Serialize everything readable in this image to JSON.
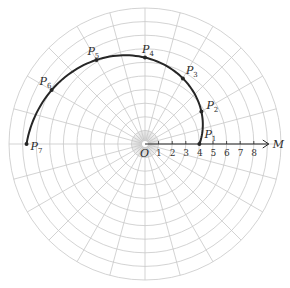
{
  "diagram": {
    "type": "polar-coordinate-grid",
    "center": {
      "x": 145,
      "y": 144
    },
    "unit_px": 13.6,
    "rings": 10,
    "spokes": 24,
    "inner_fine_spokes": 72,
    "inner_fine_radius_units": 1,
    "colors": {
      "grid": "#c8c8c8",
      "curve": "#262626",
      "axis": "#262626",
      "text": "#2a2a2a"
    },
    "origin_label": "O",
    "axis_label": "M",
    "axis_ticks": [
      "1",
      "2",
      "3",
      "4",
      "5",
      "6",
      "7",
      "8"
    ],
    "curve": {
      "equation": "r = 4 + 1.5θ",
      "theta_start_deg": 0,
      "theta_end_deg": 180
    },
    "points": [
      {
        "name": "P",
        "sub": "1",
        "theta_deg": 0,
        "r": 4.0,
        "label_dx": 5,
        "label_dy": -6
      },
      {
        "name": "P",
        "sub": "2",
        "theta_deg": 30,
        "r": 4.79,
        "label_dx": 5,
        "label_dy": -2
      },
      {
        "name": "P",
        "sub": "3",
        "theta_deg": 60,
        "r": 5.57,
        "label_dx": 3,
        "label_dy": -4
      },
      {
        "name": "P",
        "sub": "4",
        "theta_deg": 90,
        "r": 6.36,
        "label_dx": -3,
        "label_dy": -5
      },
      {
        "name": "P",
        "sub": "5",
        "theta_deg": 120,
        "r": 7.14,
        "label_dx": -9,
        "label_dy": -5
      },
      {
        "name": "P",
        "sub": "6",
        "theta_deg": 150,
        "r": 7.93,
        "label_dx": -12,
        "label_dy": -5
      },
      {
        "name": "P",
        "sub": "7",
        "theta_deg": 180,
        "r": 8.71,
        "label_dx": 4,
        "label_dy": 6
      }
    ]
  }
}
